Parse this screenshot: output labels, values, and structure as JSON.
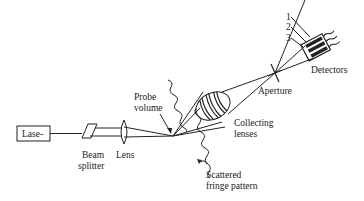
{
  "diagram": {
    "type": "laser-doppler-anemometer-schematic",
    "components": {
      "laser": {
        "label": "Lase-"
      },
      "beam_splitter": {
        "label_line1": "Beam",
        "label_line2": "splitter"
      },
      "lens": {
        "label": "Lens"
      },
      "probe_volume": {
        "label_line1": "Probe",
        "label_line2": "volume"
      },
      "collecting_lenses": {
        "label_line1": "Collecting",
        "label_line2": "lenses"
      },
      "scattered_fringe_pattern": {
        "label_line1": "Scattered",
        "label_line2": "fringe pattern"
      },
      "aperture": {
        "label": "Aperture"
      },
      "detectors": {
        "label": "Detectors",
        "numbers": [
          "1",
          "2",
          "3"
        ]
      }
    },
    "colors": {
      "line": "#222222",
      "background": "#ffffff"
    }
  }
}
